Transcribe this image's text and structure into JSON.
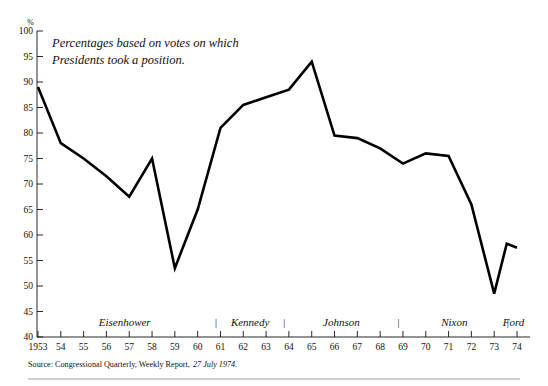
{
  "annotation": {
    "line1": "Percentages based on votes on which",
    "line2": "Presidents took a position."
  },
  "source": {
    "prefix": "Source: Congressional Quarterly, Weekly Report,",
    "date": "27 July 1974."
  },
  "axis": {
    "y_unit_label": "%",
    "y_ticks": [
      "100",
      "95",
      "90",
      "85",
      "80",
      "75",
      "70",
      "65",
      "60",
      "55",
      "50",
      "45",
      "40"
    ],
    "x_ticks": [
      "1953",
      "54",
      "55",
      "56",
      "57",
      "58",
      "59",
      "60",
      "61",
      "62",
      "63",
      "64",
      "65",
      "66",
      "67",
      "68",
      "69",
      "70",
      "71",
      "72",
      "73",
      "74"
    ]
  },
  "eras": [
    {
      "name": "Eisenhower",
      "start": 1953,
      "end": 1960.6
    },
    {
      "name": "Kennedy",
      "start": 1961,
      "end": 1963.6
    },
    {
      "name": "Johnson",
      "start": 1964,
      "end": 1968.6
    },
    {
      "name": "Nixon",
      "start": 1969,
      "end": 1973.5
    },
    {
      "name": "Ford",
      "start": 1973.7,
      "end": 1974
    }
  ],
  "era_separators": [
    "1960.8",
    "1963.8",
    "1968.8",
    "1973.6"
  ],
  "era_separator_glyph": "|",
  "colors": {
    "line": "#000000",
    "axis": "#111111",
    "background": "#ffffff",
    "rule": "#8a8a8a"
  },
  "chart_data": {
    "type": "line",
    "title": "",
    "subtitle": "",
    "xlabel": "",
    "ylabel": "%",
    "xlim": [
      1953,
      1974
    ],
    "ylim": [
      40,
      100
    ],
    "ytick_step": 5,
    "grid": false,
    "legend": "none",
    "annotations": [
      "Percentages based on votes on which Presidents took a position."
    ],
    "x": [
      1953,
      1954,
      1955,
      1956,
      1957,
      1958,
      1959,
      1960,
      1961,
      1962,
      1963,
      1964,
      1965,
      1966,
      1967,
      1968,
      1969,
      1970,
      1971,
      1972,
      1973,
      1974
    ],
    "values": [
      89.0,
      78.0,
      75.0,
      71.5,
      67.5,
      75.0,
      53.5,
      65.0,
      81.0,
      85.5,
      87.0,
      88.5,
      94.0,
      79.5,
      79.0,
      77.0,
      74.0,
      76.0,
      75.5,
      66.0,
      48.5,
      57.5
    ],
    "extra_points": [
      {
        "x": 1973.55,
        "y": 58.3,
        "note": "Ford transition uptick"
      }
    ],
    "series": [
      {
        "name": "Presidential success on congressional votes",
        "values": [
          89.0,
          78.0,
          75.0,
          71.5,
          67.5,
          75.0,
          53.5,
          65.0,
          81.0,
          85.5,
          87.0,
          88.5,
          94.0,
          79.5,
          79.0,
          77.0,
          74.0,
          76.0,
          75.5,
          66.0,
          48.5,
          57.5
        ]
      }
    ]
  }
}
